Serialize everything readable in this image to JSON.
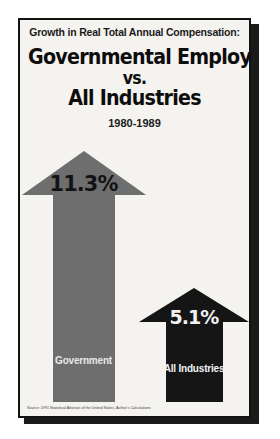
{
  "poster": {
    "kicker": "Growth in Real Total Annual Compensation:",
    "headline_line1": "Governmental Employees",
    "headline_line2": "vs.",
    "headline_line3": "All Industries",
    "date_range": "1980-1989",
    "source": "Source: 1991 Statistical Abstract of the United States, Author's Calculations",
    "colors": {
      "panel_background": "#f4f3f0",
      "frame": "#121212",
      "government_arrow": "#6e6e6e",
      "all_industries_arrow": "#151515",
      "text_dark": "#0d0d0d",
      "text_light": "#f2f2f2"
    }
  },
  "chart_data": {
    "type": "bar",
    "title": "Growth in Real Total Annual Compensation: Governmental Employees vs. All Industries",
    "subtitle": "1980-1989",
    "categories": [
      "Government",
      "All Industries"
    ],
    "values": [
      11.3,
      5.1
    ],
    "value_labels": [
      "11.3%",
      "5.1%"
    ],
    "unit": "percent",
    "xlabel": "",
    "ylabel": "Growth in Real Total Annual Compensation (%)",
    "ylim": [
      0,
      11.3
    ],
    "grid": false,
    "legend": false,
    "annotations": [
      "Source: 1991 Statistical Abstract of the United States, Author's Calculations"
    ],
    "series": [
      {
        "name": "Real total annual compensation growth, 1980-1989",
        "points": [
          {
            "category": "Government",
            "value": 11.3,
            "label": "11.3%",
            "color": "#6e6e6e",
            "marker": "up-arrow"
          },
          {
            "category": "All Industries",
            "value": 5.1,
            "label": "5.1%",
            "color": "#151515",
            "marker": "up-arrow"
          }
        ]
      }
    ]
  }
}
